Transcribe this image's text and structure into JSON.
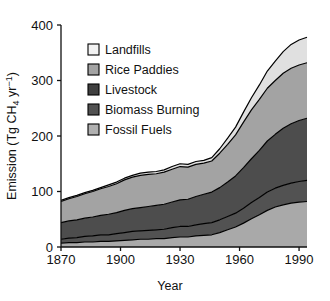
{
  "chart_data": {
    "type": "area",
    "stacked": true,
    "title": "",
    "xlabel": "Year",
    "ylabel": "Emission (Tg CH4 yr-1)",
    "ylabel_parts": {
      "prefix": "Emission (Tg CH",
      "sub": "4",
      "middle": " yr",
      "sup": "−1",
      "suffix": ")"
    },
    "xlim": [
      1870,
      1994
    ],
    "ylim": [
      0,
      400
    ],
    "xticks": [
      1870,
      1900,
      1930,
      1960,
      1990
    ],
    "yticks": [
      0,
      100,
      200,
      300,
      400
    ],
    "grid": false,
    "legend_position": "upper-left-inside",
    "x": [
      1870,
      1874,
      1878,
      1882,
      1886,
      1890,
      1894,
      1898,
      1902,
      1906,
      1910,
      1914,
      1918,
      1922,
      1926,
      1930,
      1934,
      1938,
      1942,
      1946,
      1950,
      1954,
      1958,
      1962,
      1966,
      1970,
      1974,
      1978,
      1982,
      1986,
      1990,
      1994
    ],
    "series": [
      {
        "name": "Fossil Fuels",
        "color": "#a9a9a9",
        "values": [
          7,
          8,
          8,
          9,
          9,
          10,
          10,
          11,
          12,
          13,
          14,
          14,
          15,
          15,
          17,
          18,
          18,
          20,
          21,
          22,
          26,
          31,
          36,
          43,
          51,
          58,
          66,
          72,
          76,
          79,
          81,
          82
        ]
      },
      {
        "name": "Biomass Burning",
        "color": "#525252",
        "values": [
          7,
          8,
          9,
          10,
          11,
          12,
          12,
          13,
          14,
          15,
          15,
          16,
          16,
          17,
          18,
          19,
          19,
          20,
          21,
          22,
          23,
          24,
          25,
          27,
          29,
          31,
          33,
          34,
          35,
          36,
          37,
          38
        ]
      },
      {
        "name": "Livestock",
        "color": "#4d4d4d",
        "values": [
          30,
          31,
          32,
          33,
          34,
          35,
          37,
          38,
          40,
          41,
          42,
          43,
          44,
          45,
          46,
          48,
          49,
          51,
          53,
          55,
          58,
          62,
          67,
          73,
          79,
          85,
          92,
          97,
          103,
          107,
          110,
          112
        ]
      },
      {
        "name": "Rice Paddies",
        "color": "#a3a3a3",
        "values": [
          38,
          40,
          42,
          44,
          46,
          48,
          50,
          52,
          55,
          57,
          58,
          58,
          57,
          58,
          59,
          60,
          58,
          58,
          56,
          56,
          62,
          68,
          74,
          82,
          88,
          92,
          95,
          97,
          99,
          100,
          100,
          100
        ]
      },
      {
        "name": "Landfills",
        "color": "#e0e0e0",
        "values": [
          2,
          2,
          2,
          2,
          2,
          2,
          3,
          3,
          3,
          3,
          4,
          4,
          4,
          4,
          5,
          5,
          5,
          5,
          5,
          6,
          8,
          11,
          14,
          18,
          22,
          26,
          31,
          35,
          39,
          43,
          45,
          46
        ]
      }
    ],
    "legend_order": [
      "Landfills",
      "Rice Paddies",
      "Livestock",
      "Biomass Burning",
      "Fossil Fuels"
    ],
    "legend_colors": {
      "Landfills": "#f2f2f2",
      "Rice Paddies": "#a3a3a3",
      "Livestock": "#404040",
      "Biomass Burning": "#525252",
      "Fossil Fuels": "#b0b0b0"
    },
    "total_1870": 84,
    "total_1994": 378
  },
  "axes": {
    "x_tick_labels": [
      "1870",
      "1900",
      "1930",
      "1960",
      "1990"
    ],
    "y_tick_labels": [
      "0",
      "100",
      "200",
      "300",
      "400"
    ],
    "x_axis_title": "Year"
  },
  "legend": {
    "items": [
      {
        "label": "Landfills"
      },
      {
        "label": "Rice Paddies"
      },
      {
        "label": "Livestock"
      },
      {
        "label": "Biomass Burning"
      },
      {
        "label": "Fossil Fuels"
      }
    ]
  }
}
